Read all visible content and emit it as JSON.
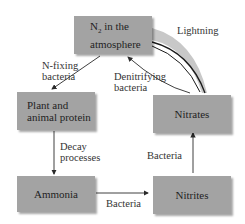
{
  "diagram": {
    "nodes": [
      {
        "id": "n2",
        "line1": "N",
        "sub": "2",
        "line1_rest": " in the",
        "line2": "atmosphere"
      },
      {
        "id": "protein",
        "line1": "Plant and",
        "line2": "animal protein"
      },
      {
        "id": "nitrates",
        "label": "Nitrates"
      },
      {
        "id": "ammonia",
        "label": "Ammonia"
      },
      {
        "id": "nitrites",
        "label": "Nitrites"
      }
    ],
    "edge_labels": {
      "lightning": "Lightning",
      "nfixing_1": "N-fixing",
      "nfixing_2": "bacteria",
      "denitrifying_1": "Denitrifying",
      "denitrifying_2": "bacteria",
      "decay_1": "Decay",
      "decay_2": "processes",
      "bacteria_ammonia_nitrites": "Bacteria",
      "bacteria_nitrites_nitrates": "Bacteria"
    },
    "edges": [
      {
        "from": "n2",
        "to": "protein",
        "label": "N-fixing bacteria"
      },
      {
        "from": "nitrates",
        "to": "n2",
        "label": "Denitrifying bacteria"
      },
      {
        "from": "n2",
        "to": "nitrates",
        "label": "Lightning"
      },
      {
        "from": "protein",
        "to": "ammonia",
        "label": "Decay processes"
      },
      {
        "from": "ammonia",
        "to": "nitrites",
        "label": "Bacteria"
      },
      {
        "from": "nitrites",
        "to": "nitrates",
        "label": "Bacteria"
      }
    ]
  }
}
